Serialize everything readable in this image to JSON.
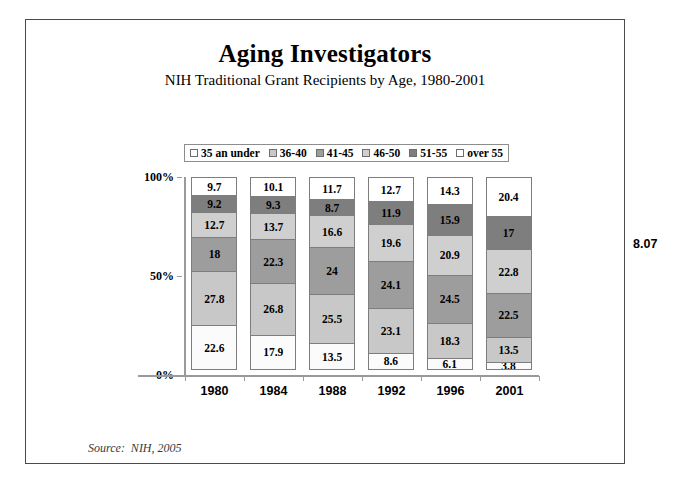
{
  "chart_data": {
    "type": "bar",
    "subtype": "stacked-column-100",
    "title": "Aging Investigators",
    "subtitle": "NIH Traditional Grant Recipients by Age, 1980-2001",
    "xlabel": "",
    "ylabel": "",
    "ylim": [
      0,
      100
    ],
    "ytick_labels": [
      "0%",
      "50%",
      "100%"
    ],
    "ytick_values": [
      0,
      50,
      100
    ],
    "grid": false,
    "legend_position": "top-center",
    "categories": [
      "1980",
      "1984",
      "1988",
      "1992",
      "1996",
      "2001"
    ],
    "series": [
      {
        "name": "35 an under",
        "color": "#fbfbfb",
        "values": [
          22.6,
          17.9,
          13.5,
          8.6,
          6.1,
          3.8
        ]
      },
      {
        "name": "36-40",
        "color": "#c8c8c8",
        "values": [
          27.8,
          26.8,
          25.5,
          23.1,
          18.3,
          13.5
        ]
      },
      {
        "name": "41-45",
        "color": "#9d9d9d",
        "values": [
          18,
          22.3,
          24,
          24.1,
          24.5,
          22.5
        ]
      },
      {
        "name": "46-50",
        "color": "#cfcfcf",
        "values": [
          12.7,
          13.7,
          16.6,
          19.6,
          20.9,
          22.8
        ]
      },
      {
        "name": "51-55",
        "color": "#7e7e7e",
        "values": [
          9.2,
          9.3,
          8.7,
          11.9,
          15.9,
          17
        ]
      },
      {
        "name": "over 55",
        "color": "#ffffff",
        "values": [
          9.7,
          10.1,
          11.7,
          12.7,
          14.3,
          20.4
        ]
      }
    ],
    "data_labels": {
      "1980": [
        "22.6",
        "27.8",
        "18",
        "12.7",
        "9.2",
        "9.7"
      ],
      "1984": [
        "17.9",
        "26.8",
        "22.3",
        "13.7",
        "9.3",
        "10.1"
      ],
      "1988": [
        "13.5",
        "25.5",
        "24",
        "16.6",
        "8.7",
        "11.7"
      ],
      "1992": [
        "8.6",
        "23.1",
        "24.1",
        "19.6",
        "11.9",
        "12.7"
      ],
      "1996": [
        "6.1",
        "18.3",
        "24.5",
        "20.9",
        "15.9",
        "14.3"
      ],
      "2001": [
        "3.8",
        "13.5",
        "22.5",
        "22.8",
        "17",
        "20.4"
      ]
    },
    "annotations": {
      "source": "Source:  NIH, 2005"
    }
  },
  "legend": {
    "items": [
      {
        "label": "35 an under",
        "color": "#fbfbfb"
      },
      {
        "label": "36-40",
        "color": "#c8c8c8"
      },
      {
        "label": "41-45",
        "color": "#9d9d9d"
      },
      {
        "label": "46-50",
        "color": "#cfcfcf"
      },
      {
        "label": "51-55",
        "color": "#7e7e7e"
      },
      {
        "label": "over 55",
        "color": "#ffffff"
      }
    ]
  },
  "page": {
    "number": "8.07"
  }
}
